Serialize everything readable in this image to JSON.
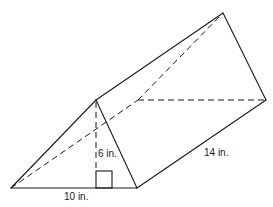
{
  "figure": {
    "type": "triangular-prism",
    "labels": {
      "base": "10 in.",
      "height": "6 in.",
      "length": "14 in."
    },
    "colors": {
      "stroke": "#1a1a1a",
      "background": "#ffffff"
    }
  }
}
